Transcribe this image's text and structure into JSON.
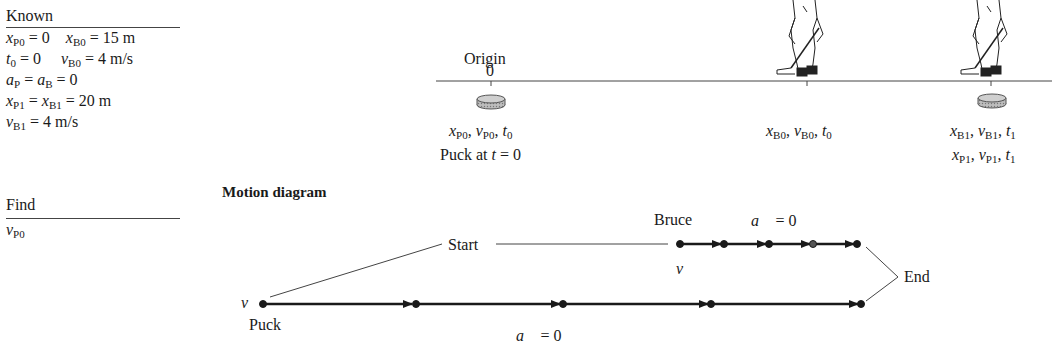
{
  "known_panel": {
    "heading": "Known",
    "rows": [
      [
        "x_P0 = 0",
        "x_B0 = 15 m"
      ],
      [
        "t_0 = 0",
        "v_B0 = 4 m/s"
      ],
      [
        "a_P = a_B = 0"
      ],
      [
        "x_P1 = x_B1 = 20 m"
      ],
      [
        "v_B1 = 4 m/s"
      ]
    ],
    "values": {
      "xP0": "0",
      "xB0": "15 m",
      "t0": "0",
      "vB0": "4 m/s",
      "aP_aB": "0",
      "xP1_xB1": "20 m",
      "vB1": "4 m/s"
    }
  },
  "find_panel": {
    "heading": "Find",
    "unknown": "v_P0"
  },
  "pictorial": {
    "origin_label": "Origin",
    "origin_tick_label": "0",
    "puck_start_label": "x_P0, v_P0, t_0",
    "puck_caption": "Puck at t = 0",
    "bruce_start_label": "x_B0, v_B0, t_0",
    "end_label_bruce": "x_B1, v_B1, t_1",
    "end_label_puck": "x_P1, v_P1, t_1",
    "icons": [
      "hockey-puck-icon",
      "hockey-player-icon"
    ]
  },
  "motion_diagram": {
    "title": "Motion diagram",
    "start_label": "Start",
    "end_label": "End",
    "bruce": {
      "label": "Bruce",
      "velocity_label": "v",
      "accel_label": "a = 0",
      "dots": 5
    },
    "puck": {
      "label": "Puck",
      "velocity_label": "v",
      "accel_label": "a = 0",
      "dots": 5
    },
    "colors": {
      "ink": "#1a1a1a",
      "line": "#555555"
    }
  }
}
